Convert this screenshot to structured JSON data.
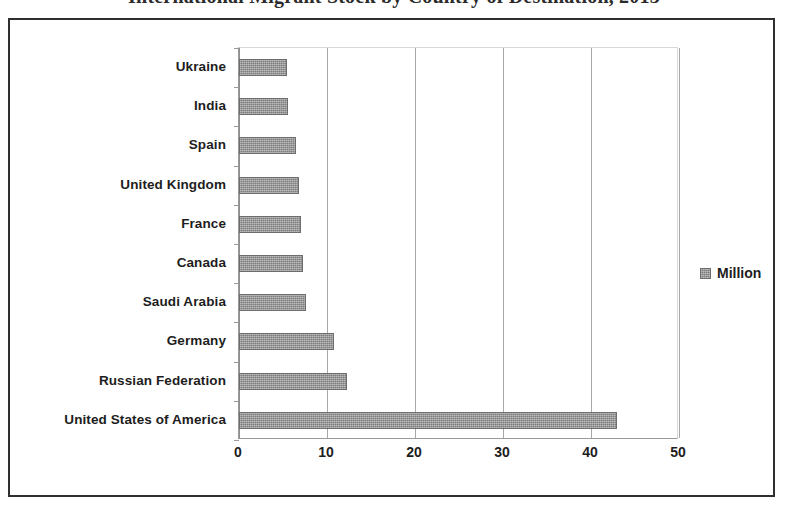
{
  "title": "International Migrant Stock by Country of Destination, 2013",
  "chart_data": {
    "type": "bar",
    "orientation": "horizontal",
    "title": "International Migrant Stock by Country of Destination, 2013",
    "xlabel": "",
    "ylabel": "",
    "xlim": [
      0,
      50
    ],
    "xticks": [
      "0",
      "10",
      "20",
      "30",
      "40",
      "50"
    ],
    "xtick_values": [
      0,
      10,
      20,
      30,
      40,
      50
    ],
    "grid": "vertical",
    "legend_position": "right",
    "legend": [
      "Million"
    ],
    "series": [
      {
        "name": "Million",
        "color": "#7d7d7d",
        "values": [
          5.5,
          5.6,
          6.5,
          6.8,
          7.0,
          7.3,
          7.6,
          10.8,
          12.3,
          43.0
        ]
      }
    ],
    "categories": [
      "Ukraine",
      "India",
      "Spain",
      "United Kingdom",
      "France",
      "Canada",
      "Saudi Arabia",
      "Germany",
      "Russian Federation",
      "United States of America"
    ]
  }
}
